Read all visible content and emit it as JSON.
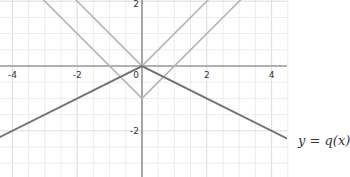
{
  "chart_data": {
    "type": "line",
    "title": "",
    "xlabel": "",
    "ylabel": "",
    "xlim": [
      -4.4,
      4.5
    ],
    "ylim": [
      -3.4,
      2.05
    ],
    "grid": true,
    "grid_step": 0.5,
    "x_ticks": [
      -4,
      -2,
      0,
      2,
      4
    ],
    "y_ticks": [
      -2,
      2
    ],
    "x_tick_labels": [
      "-4",
      "-2",
      "0",
      "2",
      "4"
    ],
    "y_tick_labels": [
      "-2",
      "2"
    ],
    "series": [
      {
        "name": "y = |x|",
        "color": "#b5b5b5",
        "x": [
          -4.4,
          0,
          4.5
        ],
        "y": [
          4.4,
          0,
          4.5
        ]
      },
      {
        "name": "y = |x| - 1",
        "color": "#b5b5b5",
        "x": [
          -4.4,
          0,
          4.5
        ],
        "y": [
          3.4,
          -1,
          3.5
        ]
      },
      {
        "name": "y = q(x)",
        "color": "#707070",
        "x": [
          -4.4,
          0,
          4.5
        ],
        "y": [
          -2.2,
          0,
          -2.25
        ]
      }
    ],
    "annotations": [
      {
        "text": "y = q(x)",
        "x": 4.5,
        "y": -2.25
      }
    ]
  },
  "labels": {
    "function_label": "y = q(x)"
  }
}
